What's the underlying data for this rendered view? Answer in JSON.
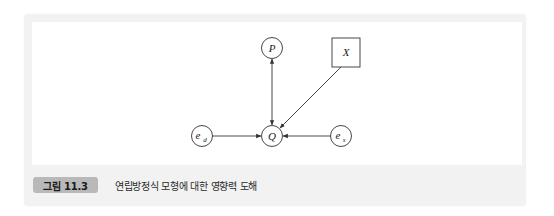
{
  "figure": {
    "badge": "그림 11.3",
    "caption": "연립방정식 모형에 대한 영향력 도해"
  },
  "diagram": {
    "nodes": [
      {
        "id": "P",
        "label": "P",
        "shape": "circle"
      },
      {
        "id": "X",
        "label": "X",
        "shape": "square"
      },
      {
        "id": "Q",
        "label": "Q",
        "shape": "circle"
      },
      {
        "id": "e_d",
        "label": "e",
        "subscript": "d",
        "shape": "circle"
      },
      {
        "id": "e_s",
        "label": "e",
        "subscript": "s",
        "shape": "circle"
      }
    ],
    "edges": [
      {
        "from": "P",
        "to": "Q",
        "type": "bidirectional"
      },
      {
        "from": "X",
        "to": "Q",
        "type": "directed"
      },
      {
        "from": "e_d",
        "to": "Q",
        "type": "directed"
      },
      {
        "from": "e_s",
        "to": "Q",
        "type": "directed"
      }
    ],
    "colors": {
      "stroke": "#333333",
      "panel": "#f2f2f2",
      "badge": "#b9b9b9"
    }
  }
}
